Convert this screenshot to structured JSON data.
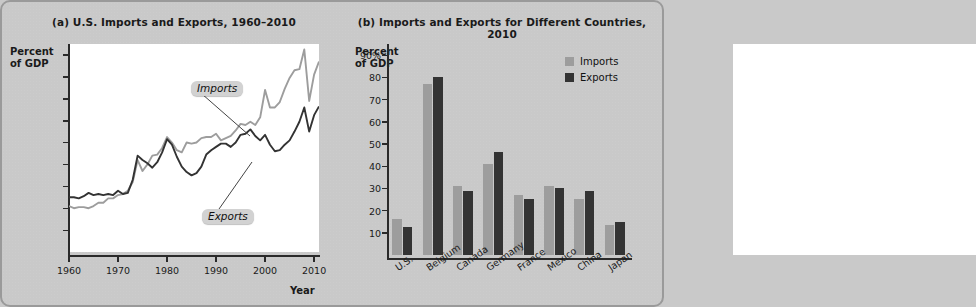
{
  "figure": {
    "background_color": "#c9c9c9",
    "series_colors": {
      "imports": "#9d9d9d",
      "exports": "#333333"
    }
  },
  "panel_a": {
    "title": "(a) U.S. Imports and Exports, 1960–2010",
    "y_axis_title": "Percent\nof GDP",
    "x_axis_title": "Year",
    "y_ticks": [
      "18%",
      "16",
      "14",
      "12",
      "10",
      "8",
      "6",
      "4",
      "2"
    ],
    "x_ticks": [
      "1960",
      "1970",
      "1980",
      "1990",
      "2000",
      "2010"
    ],
    "callouts": {
      "imports": "Imports",
      "exports": "Exports"
    }
  },
  "panel_b": {
    "title": "(b) Imports and Exports for Different Countries, 2010",
    "y_axis_title": "Percent\nof GDP",
    "y_ticks": [
      "90%",
      "80",
      "70",
      "60",
      "50",
      "40",
      "30",
      "20",
      "10"
    ],
    "legend": [
      {
        "label": "Imports",
        "color": "#9d9d9d"
      },
      {
        "label": "Exports",
        "color": "#333333"
      }
    ]
  },
  "chart_data": [
    {
      "id": "panel_a",
      "type": "line",
      "title": "(a) U.S. Imports and Exports, 1960–2010",
      "xlabel": "Year",
      "ylabel": "Percent of GDP",
      "xlim": [
        1960,
        2011
      ],
      "ylim": [
        0,
        19
      ],
      "y_tick_values": [
        2,
        4,
        6,
        8,
        10,
        12,
        14,
        16,
        18
      ],
      "x_tick_values": [
        1960,
        1970,
        1980,
        1990,
        2000,
        2010
      ],
      "grid": false,
      "legend_position": "inline-callouts",
      "annotations": [
        "Imports",
        "Exports"
      ],
      "series": [
        {
          "name": "Imports",
          "color": "#9d9d9d",
          "x": [
            1960,
            1961,
            1962,
            1963,
            1964,
            1965,
            1966,
            1967,
            1968,
            1969,
            1970,
            1971,
            1972,
            1973,
            1974,
            1975,
            1976,
            1977,
            1978,
            1979,
            1980,
            1981,
            1982,
            1983,
            1984,
            1985,
            1986,
            1987,
            1988,
            1989,
            1990,
            1991,
            1992,
            1993,
            1994,
            1995,
            1996,
            1997,
            1998,
            1999,
            2000,
            2001,
            2002,
            2003,
            2004,
            2005,
            2006,
            2007,
            2008,
            2009,
            2010,
            2011
          ],
          "values": [
            4.2,
            4.0,
            4.1,
            4.1,
            4.0,
            4.2,
            4.5,
            4.5,
            4.9,
            4.9,
            5.2,
            5.3,
            5.6,
            6.4,
            8.4,
            7.4,
            8.0,
            8.8,
            8.9,
            9.5,
            10.5,
            10.0,
            9.3,
            9.1,
            10.0,
            9.9,
            10.0,
            10.4,
            10.5,
            10.5,
            10.8,
            10.2,
            10.4,
            10.6,
            11.1,
            11.7,
            11.6,
            11.9,
            11.6,
            12.3,
            14.8,
            13.2,
            13.2,
            13.7,
            14.9,
            15.9,
            16.6,
            16.7,
            18.5,
            13.8,
            16.2,
            17.4
          ]
        },
        {
          "name": "Exports",
          "color": "#333333",
          "x": [
            1960,
            1961,
            1962,
            1963,
            1964,
            1965,
            1966,
            1967,
            1968,
            1969,
            1970,
            1971,
            1972,
            1973,
            1974,
            1975,
            1976,
            1977,
            1978,
            1979,
            1980,
            1981,
            1982,
            1983,
            1984,
            1985,
            1986,
            1987,
            1988,
            1989,
            1990,
            1991,
            1992,
            1993,
            1994,
            1995,
            1996,
            1997,
            1998,
            1999,
            2000,
            2001,
            2002,
            2003,
            2004,
            2005,
            2006,
            2007,
            2008,
            2009,
            2010,
            2011
          ],
          "values": [
            5.0,
            5.0,
            4.9,
            5.1,
            5.4,
            5.2,
            5.3,
            5.2,
            5.3,
            5.2,
            5.6,
            5.3,
            5.4,
            6.6,
            8.8,
            8.4,
            8.1,
            7.7,
            8.2,
            9.1,
            10.3,
            9.8,
            8.7,
            7.8,
            7.3,
            7.0,
            7.2,
            7.8,
            8.9,
            9.3,
            9.6,
            9.9,
            9.9,
            9.6,
            10.0,
            10.7,
            10.8,
            11.2,
            10.6,
            10.2,
            10.7,
            9.8,
            9.2,
            9.3,
            9.8,
            10.2,
            11.0,
            11.9,
            13.2,
            11.0,
            12.5,
            13.3
          ]
        }
      ]
    },
    {
      "id": "panel_b",
      "type": "bar",
      "title": "(b) Imports and Exports for Different Countries, 2010",
      "xlabel": "",
      "ylabel": "Percent of GDP",
      "ylim": [
        0,
        95
      ],
      "y_tick_values": [
        10,
        20,
        30,
        40,
        50,
        60,
        70,
        80,
        90
      ],
      "grid": false,
      "legend_position": "top-right",
      "categories": [
        "U.S.",
        "Belgium",
        "Canada",
        "Germany",
        "France",
        "Mexico",
        "China",
        "Japan"
      ],
      "series": [
        {
          "name": "Imports",
          "color": "#9d9d9d",
          "values": [
            16,
            77,
            31,
            41,
            27,
            31,
            25,
            13.5
          ]
        },
        {
          "name": "Exports",
          "color": "#333333",
          "values": [
            12.5,
            80,
            29,
            46.5,
            25,
            30,
            29,
            15
          ]
        }
      ]
    }
  ]
}
